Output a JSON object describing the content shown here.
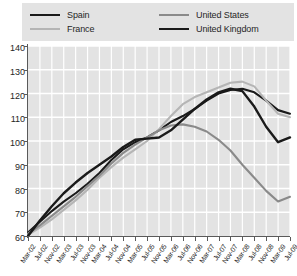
{
  "legend": {
    "position": "top",
    "items": [
      {
        "label": "Spain",
        "color": "#1a1a1a"
      },
      {
        "label": "United States",
        "color": "#8a8a8a"
      },
      {
        "label": "France",
        "color": "#b5b5b5"
      },
      {
        "label": "United Kingdom",
        "color": "#1a1a1a"
      }
    ]
  },
  "chart_data": {
    "type": "line",
    "title": "",
    "xlabel": "",
    "ylabel": "",
    "ylim": [
      60,
      140
    ],
    "yticks": [
      60,
      70,
      80,
      90,
      100,
      110,
      120,
      130,
      140
    ],
    "grid": true,
    "plot_background": "#e3e3e3",
    "gridline_color": "#ffffff",
    "x": [
      "Mar-02",
      "Jul-02",
      "Nov-02",
      "Mar-03",
      "Jul-03",
      "Nov-03",
      "Mar-04",
      "Jul-04",
      "Nov-04",
      "Mar-05",
      "Jul-05",
      "Nov-05",
      "Mar-06",
      "Jul-06",
      "Nov-06",
      "Mar-07",
      "Jul-07",
      "Nov-07",
      "Mar-08",
      "Jul-08",
      "Nov-08",
      "Mar-09",
      "Jul-09"
    ],
    "series": [
      {
        "name": "Spain",
        "color": "#1a1a1a",
        "width": 2.1,
        "values": [
          61.5,
          66.0,
          70.5,
          74.5,
          78.0,
          82.0,
          86.5,
          92.0,
          96.5,
          99.5,
          101.5,
          104.5,
          108.0,
          110.5,
          113.5,
          117.0,
          120.0,
          121.5,
          122.0,
          120.5,
          117.0,
          113.0,
          111.5
        ]
      },
      {
        "name": "France",
        "color": "#b5b5b5",
        "width": 2.1,
        "values": [
          60.5,
          63.5,
          67.0,
          71.0,
          75.0,
          79.5,
          84.5,
          89.0,
          93.0,
          96.5,
          100.0,
          105.0,
          110.5,
          115.5,
          118.5,
          120.5,
          122.5,
          124.5,
          125.0,
          123.0,
          117.0,
          111.5,
          110.0
        ]
      },
      {
        "name": "United States",
        "color": "#8a8a8a",
        "width": 2.1,
        "values": [
          61.0,
          64.5,
          68.5,
          72.5,
          76.5,
          81.0,
          85.5,
          90.5,
          95.0,
          98.5,
          101.5,
          104.5,
          106.5,
          107.0,
          106.0,
          104.0,
          100.5,
          96.0,
          90.0,
          84.5,
          79.0,
          74.5,
          76.5
        ]
      },
      {
        "name": "United Kingdom",
        "color": "#1a1a1a",
        "width": 2.4,
        "values": [
          60.0,
          66.5,
          72.5,
          78.0,
          82.5,
          86.5,
          90.0,
          93.5,
          97.5,
          100.5,
          101.0,
          101.5,
          104.5,
          109.0,
          113.5,
          117.5,
          120.5,
          122.0,
          121.0,
          114.5,
          106.0,
          99.5,
          101.5
        ]
      }
    ]
  }
}
